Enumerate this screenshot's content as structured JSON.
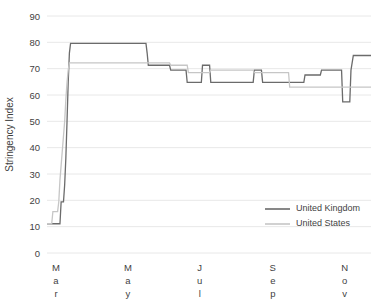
{
  "chart_data": {
    "type": "line",
    "title": "",
    "xlabel": "",
    "ylabel": "Stringency Index",
    "ylim": [
      0,
      90
    ],
    "yticks": [
      0,
      10,
      20,
      30,
      40,
      50,
      60,
      70,
      80,
      90
    ],
    "grid": true,
    "grid_axis": "y",
    "legend_position": "inside-bottom-right",
    "xtick_labels": [
      "Mar",
      "May",
      "Jul",
      "Sep",
      "Nov"
    ],
    "xtick_positions": [
      0,
      61,
      122,
      184,
      245
    ],
    "x_range": [
      0,
      275
    ],
    "x_unit": "days since 1 March",
    "series": [
      {
        "name": "United Kingdom",
        "color": "#6b6b6b",
        "points": [
          [
            0,
            11.11
          ],
          [
            5,
            11.11
          ],
          [
            11,
            11.11
          ],
          [
            12,
            19.44
          ],
          [
            14,
            19.44
          ],
          [
            15,
            25.93
          ],
          [
            16,
            36.11
          ],
          [
            17,
            50.0
          ],
          [
            18,
            64.81
          ],
          [
            19,
            75.93
          ],
          [
            20,
            79.63
          ],
          [
            22,
            79.63
          ],
          [
            60,
            79.63
          ],
          [
            76,
            79.63
          ],
          [
            84,
            79.63
          ],
          [
            85,
            75.93
          ],
          [
            86,
            71.3
          ],
          [
            96,
            71.3
          ],
          [
            104,
            71.3
          ],
          [
            105,
            69.44
          ],
          [
            112,
            69.44
          ],
          [
            118,
            69.44
          ],
          [
            119,
            64.81
          ],
          [
            126,
            64.81
          ],
          [
            131,
            64.81
          ],
          [
            132,
            71.3
          ],
          [
            138,
            71.3
          ],
          [
            139,
            64.81
          ],
          [
            150,
            64.81
          ],
          [
            160,
            64.81
          ],
          [
            161,
            64.81
          ],
          [
            168,
            64.81
          ],
          [
            175,
            64.81
          ],
          [
            176,
            69.44
          ],
          [
            182,
            69.44
          ],
          [
            183,
            64.81
          ],
          [
            196,
            64.81
          ],
          [
            205,
            64.81
          ],
          [
            206,
            64.81
          ],
          [
            212,
            64.81
          ],
          [
            218,
            64.81
          ],
          [
            219,
            67.59
          ],
          [
            226,
            67.59
          ],
          [
            232,
            67.59
          ],
          [
            233,
            69.44
          ],
          [
            246,
            69.44
          ],
          [
            250,
            69.44
          ],
          [
            251,
            57.41
          ],
          [
            257,
            57.41
          ],
          [
            258,
            69.44
          ],
          [
            260,
            75.0
          ],
          [
            275,
            75.0
          ]
        ]
      },
      {
        "name": "United States",
        "color": "#c6c6c6",
        "points": [
          [
            0,
            11.11
          ],
          [
            4,
            11.11
          ],
          [
            5,
            15.74
          ],
          [
            9,
            15.74
          ],
          [
            10,
            19.44
          ],
          [
            11,
            27.78
          ],
          [
            13,
            38.89
          ],
          [
            15,
            50.0
          ],
          [
            16,
            58.33
          ],
          [
            17,
            64.81
          ],
          [
            18,
            69.44
          ],
          [
            19,
            72.22
          ],
          [
            21,
            72.22
          ],
          [
            60,
            72.22
          ],
          [
            90,
            72.22
          ],
          [
            104,
            72.22
          ],
          [
            105,
            71.3
          ],
          [
            115,
            71.3
          ],
          [
            119,
            71.3
          ],
          [
            120,
            68.52
          ],
          [
            130,
            68.52
          ],
          [
            138,
            68.52
          ],
          [
            139,
            69.44
          ],
          [
            150,
            69.44
          ],
          [
            160,
            69.44
          ],
          [
            168,
            69.44
          ],
          [
            175,
            69.44
          ],
          [
            176,
            68.52
          ],
          [
            190,
            68.52
          ],
          [
            200,
            68.52
          ],
          [
            205,
            68.52
          ],
          [
            206,
            62.96
          ],
          [
            218,
            62.96
          ],
          [
            232,
            62.96
          ],
          [
            240,
            62.96
          ],
          [
            248,
            62.96
          ],
          [
            250,
            62.96
          ],
          [
            252,
            62.96
          ],
          [
            255,
            62.96
          ],
          [
            258,
            62.96
          ],
          [
            275,
            62.96
          ]
        ]
      }
    ],
    "legend": [
      {
        "label": "United Kingdom",
        "color": "#6b6b6b"
      },
      {
        "label": "United States",
        "color": "#c6c6c6"
      }
    ]
  }
}
